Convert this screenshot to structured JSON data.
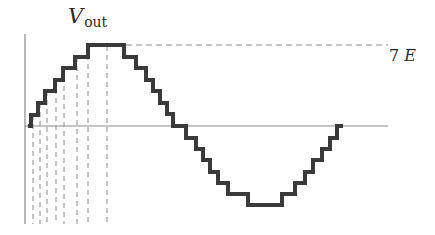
{
  "diagram": {
    "labels": {
      "y_axis_symbol": "V",
      "y_axis_subscript": "out",
      "peak_label_number": "7",
      "peak_label_unit": "E"
    },
    "colors": {
      "waveform": "#3a3a3a",
      "axes": "#8a8a8a",
      "dashed": "#8a8a8a",
      "text": "#2a2a2a"
    },
    "geometry": {
      "x_axis_y": 126,
      "y_axis_x": 25,
      "peak_y": 45,
      "trough_y": 205,
      "step_levels": 7,
      "vertical_dashed_x": [
        33,
        40,
        47,
        56,
        64,
        77,
        88,
        107
      ]
    },
    "waveform_points": "28,126 31,126 31,115 38,115 38,103 45,103 45,91 55,91 55,80 63,80 63,68 75,68 75,57 88,57 88,45 124,45 124,57 136,57 136,68 146,68 146,80 153,80 153,91 160,91 160,103 167,103 167,114 173,114 173,126 180,126 180,126 186,126 186,138 196,138 196,149 203,149 203,160 210,160 210,172 218,172 218,183 228,183 228,194 248,194 248,205 282,205 282,194 295,194 295,183 305,183 305,172 313,172 313,160 322,160 322,149 330,149 330,138 337,138 337,126 343,126"
  }
}
